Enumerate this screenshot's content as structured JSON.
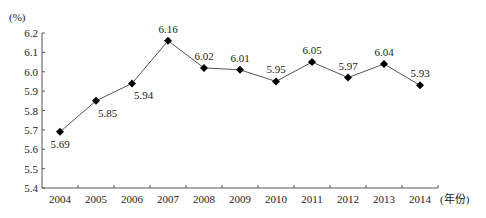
{
  "chart_data": {
    "type": "line",
    "title": "",
    "xlabel": "(年份)",
    "ylabel": "(%)",
    "categories": [
      "2004",
      "2005",
      "2006",
      "2007",
      "2008",
      "2009",
      "2010",
      "2011",
      "2012",
      "2013",
      "2014"
    ],
    "series": [
      {
        "name": "rate",
        "values": [
          5.69,
          5.85,
          5.94,
          6.16,
          6.02,
          6.01,
          5.95,
          6.05,
          5.97,
          6.04,
          5.93
        ],
        "labels": [
          "5.69",
          "5.85",
          "5.94",
          "6.16",
          "6.02",
          "6.01",
          "5.95",
          "6.05",
          "5.97",
          "6.04",
          "5.93"
        ],
        "marker": "diamond",
        "line_color": "#555555",
        "marker_color": "#000000"
      }
    ],
    "ylim": [
      5.4,
      6.2
    ],
    "yticks": [
      "5.4",
      "5.5",
      "5.6",
      "5.7",
      "5.8",
      "5.9",
      "6.0",
      "6.1",
      "6.2"
    ],
    "grid": false,
    "legend": null
  }
}
